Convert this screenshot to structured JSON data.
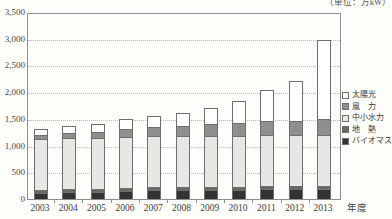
{
  "unit_note": "（単位：万kW）",
  "x_axis_title": "年度",
  "y_axis": {
    "min": 0,
    "max": 3500,
    "step": 500,
    "tick_labels": [
      "0",
      "500",
      "1,000",
      "1,500",
      "2,000",
      "2,500",
      "3,000",
      "3,500"
    ]
  },
  "legend": {
    "position": "inside-right",
    "items": [
      {
        "label": "太陽光",
        "swatch_color": "#ffffff"
      },
      {
        "label": "風　力",
        "swatch_color": "#8f8f8f"
      },
      {
        "label": "中小水力",
        "swatch_color": "#e7e7e3"
      },
      {
        "label": "地　熱",
        "swatch_color": "#686868"
      },
      {
        "label": "バイオマス",
        "swatch_color": "#333333"
      }
    ]
  },
  "chart_data": {
    "type": "bar",
    "stacked": true,
    "title": "",
    "xlabel": "年度",
    "ylabel": "",
    "unit": "万kW",
    "ylim": [
      0,
      3500
    ],
    "grid": "dotted-horizontal",
    "categories": [
      "2003",
      "2004",
      "2005",
      "2006",
      "2007",
      "2008",
      "2009",
      "2010",
      "2011",
      "2012",
      "2013"
    ],
    "series": [
      {
        "name": "バイオマス",
        "color": "#333333",
        "values": [
          120,
          130,
          140,
          150,
          160,
          165,
          170,
          175,
          180,
          185,
          185
        ]
      },
      {
        "name": "地熱",
        "color": "#686868",
        "values": [
          50,
          50,
          50,
          50,
          50,
          50,
          50,
          50,
          50,
          50,
          50
        ]
      },
      {
        "name": "中小水力",
        "color": "#e7e7e3",
        "values": [
          950,
          950,
          950,
          950,
          950,
          950,
          950,
          950,
          950,
          950,
          950
        ]
      },
      {
        "name": "風力",
        "color": "#8f8f8f",
        "values": [
          80,
          95,
          110,
          155,
          170,
          195,
          220,
          245,
          255,
          265,
          295
        ]
      },
      {
        "name": "太陽光",
        "color": "#ffffff",
        "values": [
          110,
          130,
          155,
          185,
          210,
          235,
          295,
          420,
          575,
          750,
          1470
        ]
      }
    ],
    "totals": [
      1310,
      1355,
      1405,
      1490,
      1540,
      1595,
      1685,
      1840,
      2010,
      2200,
      2950
    ],
    "legend_order_top_to_bottom": [
      "太陽光",
      "風力",
      "中小水力",
      "地熱",
      "バイオマス"
    ]
  },
  "colors": {
    "frame": "#8f8f8f",
    "gridline": "#b8b8b4",
    "text": "#3a3a3a",
    "background": "#fdfdfa"
  }
}
